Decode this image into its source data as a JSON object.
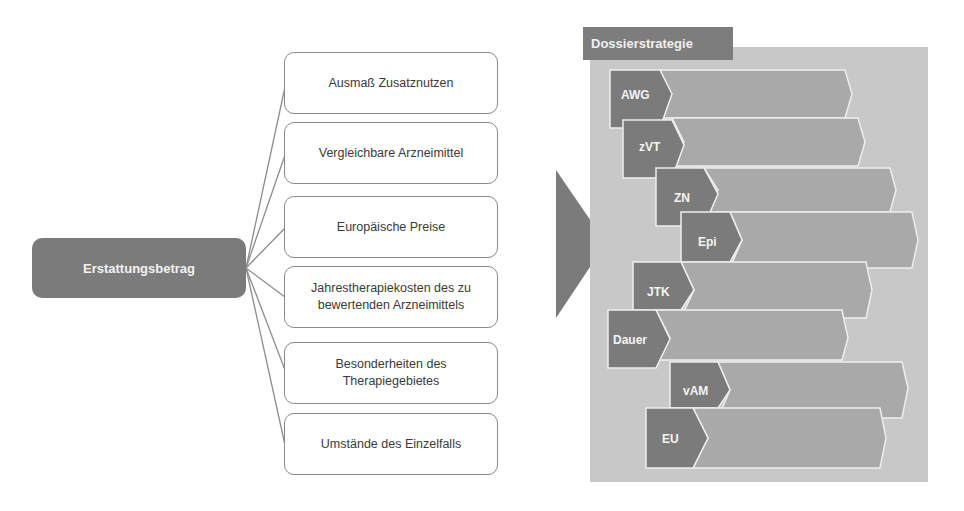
{
  "root": {
    "label": "Erstattungsbetrag"
  },
  "factors": [
    {
      "label": "Ausmaß Zusatznutzen"
    },
    {
      "label": "Vergleichbare Arzneimittel"
    },
    {
      "label": "Europäische Preise"
    },
    {
      "label": "Jahrestherapiekosten des zu bewertenden Arzneimittels"
    },
    {
      "label": "Besonderheiten des Therapiegebietes"
    },
    {
      "label": "Umstände des Einzelfalls"
    }
  ],
  "dossier": {
    "title": "Dossierstrategie",
    "rows": [
      {
        "label": "AWG"
      },
      {
        "label": "zVT"
      },
      {
        "label": "ZN"
      },
      {
        "label": "Epi"
      },
      {
        "label": "JTK"
      },
      {
        "label": "Dauer"
      },
      {
        "label": "vAM"
      },
      {
        "label": "EU"
      }
    ]
  },
  "colors": {
    "dark": "#7b7b7b",
    "panel": "#c8c8c8",
    "arrow_body": "#a8a8a8",
    "line": "#8a8a8a"
  }
}
